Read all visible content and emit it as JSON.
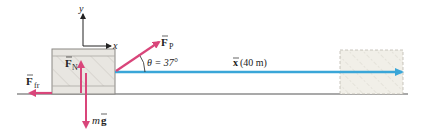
{
  "diagram": {
    "labels": {
      "axis_y": "y",
      "axis_x": "x",
      "force_pull": "F",
      "force_pull_sub": "P",
      "angle": "θ = 37°",
      "displacement": "x (40 m)",
      "normal": "F",
      "normal_sub": "N",
      "friction": "F",
      "friction_sub": "fr",
      "weight_m": "m",
      "weight_g": "g"
    },
    "values": {
      "angle_deg": 37,
      "displacement_m": 40
    },
    "colors": {
      "force": "#d9457a",
      "displacement": "#3aa6d8",
      "block_fill": "#e8e6e1",
      "block_band": "#d9d7d2",
      "block_border": "#8a8884",
      "ground": "#555555",
      "ghost_fill": "#f1efe8",
      "axis": "#222222"
    }
  }
}
